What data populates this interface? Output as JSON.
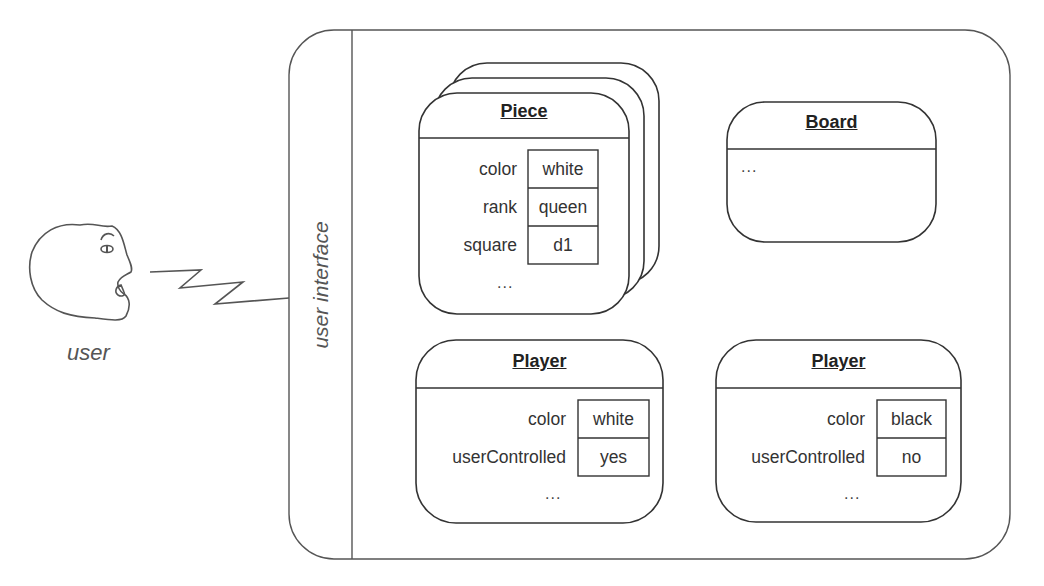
{
  "user": {
    "label": "user",
    "icon": "user-face-icon"
  },
  "interface": {
    "label": "user interface"
  },
  "objects": {
    "piece": {
      "title": "Piece",
      "stacked": true,
      "attributes": [
        {
          "name": "color",
          "value": "white"
        },
        {
          "name": "rank",
          "value": "queen"
        },
        {
          "name": "square",
          "value": "d1"
        }
      ],
      "ellipsis": "..."
    },
    "board": {
      "title": "Board",
      "ellipsis": "..."
    },
    "player_white": {
      "title": "Player",
      "attributes": [
        {
          "name": "color",
          "value": "white"
        },
        {
          "name": "userControlled",
          "value": "yes"
        }
      ],
      "ellipsis": "..."
    },
    "player_black": {
      "title": "Player",
      "attributes": [
        {
          "name": "color",
          "value": "black"
        },
        {
          "name": "userControlled",
          "value": "no"
        }
      ],
      "ellipsis": "..."
    }
  },
  "colors": {
    "stroke": "#333333",
    "background": "#ffffff"
  }
}
